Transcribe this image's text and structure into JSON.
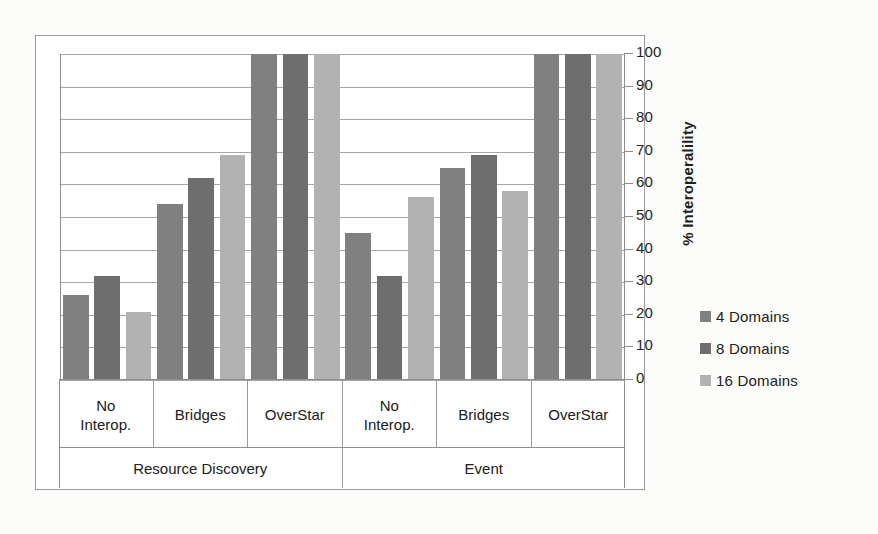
{
  "chart_data": {
    "type": "bar",
    "title": "",
    "xlabel": "",
    "ylabel": "% Interoperalility",
    "ylim": [
      0,
      100
    ],
    "ytick_values": [
      100,
      90,
      80,
      70,
      60,
      50,
      40,
      30,
      20,
      10,
      0
    ],
    "ytick_labels": [
      "100",
      "90",
      "80",
      "70",
      "60",
      "50",
      "40",
      "30",
      "20",
      "10",
      "0"
    ],
    "grid": true,
    "legend_position": "right",
    "group_labels": [
      "Resource Discovery",
      "Event"
    ],
    "categories": [
      "No\nInterop.",
      "Bridges",
      "OverStar",
      "No\nInterop.",
      "Bridges",
      "OverStar"
    ],
    "series": [
      {
        "name": "4 Domains",
        "color": "#808080",
        "values": [
          26,
          54,
          100,
          45,
          65,
          100
        ]
      },
      {
        "name": "8 Domains",
        "color": "#6e6e6e",
        "values": [
          32,
          62,
          100,
          32,
          69,
          100
        ]
      },
      {
        "name": "16 Domains",
        "color": "#b2b2b2",
        "values": [
          21,
          69,
          100,
          56,
          58,
          100
        ]
      }
    ]
  },
  "axis": {
    "y_title": "% Interoperalility"
  },
  "legend": {
    "items": [
      {
        "label": "4 Domains",
        "color": "#808080"
      },
      {
        "label": "8 Domains",
        "color": "#6e6e6e"
      },
      {
        "label": "16 Domains",
        "color": "#b2b2b2"
      }
    ]
  },
  "x_axis": {
    "categories": [
      {
        "line1": "No",
        "line2": "Interop."
      },
      {
        "line1": "Bridges",
        "line2": ""
      },
      {
        "line1": "OverStar",
        "line2": ""
      },
      {
        "line1": "No",
        "line2": "Interop."
      },
      {
        "line1": "Bridges",
        "line2": ""
      },
      {
        "line1": "OverStar",
        "line2": ""
      }
    ],
    "groups": [
      {
        "label": "Resource Discovery"
      },
      {
        "label": "Event"
      }
    ]
  }
}
